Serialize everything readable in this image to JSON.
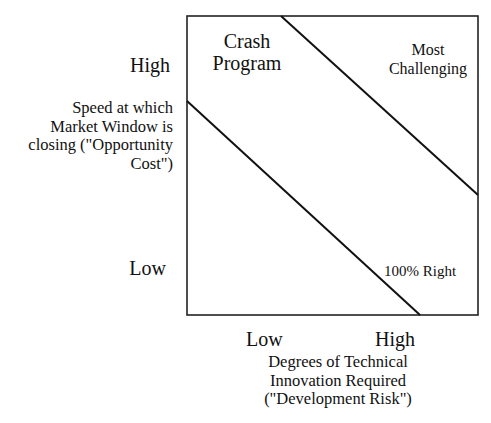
{
  "diagram": {
    "type": "quadrant-diagram",
    "y_axis": {
      "high_label": "High",
      "low_label": "Low",
      "title_lines": [
        "Speed at which",
        "Market Window is",
        "closing (\"Opportunity",
        "Cost\")"
      ]
    },
    "x_axis": {
      "low_label": "Low",
      "high_label": "High",
      "title_lines": [
        "Degrees of Technical",
        "Innovation Required",
        "(\"Development Risk\")"
      ]
    },
    "regions": {
      "crash_program": [
        "Crash",
        "Program"
      ],
      "most_challenging": [
        "Most",
        "Challenging"
      ],
      "hundred_percent_right": "100% Right"
    },
    "colors": {
      "line": "#111111",
      "background": "#ffffff"
    }
  }
}
